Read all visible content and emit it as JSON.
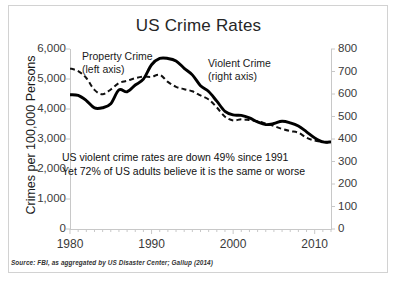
{
  "chart_data": {
    "type": "line",
    "title": "US Crime Rates",
    "xlabel": "",
    "ylabel": "Crimes per 100,000 Persons",
    "y2label": "",
    "xlim": [
      1980,
      2012
    ],
    "ylim": [
      0,
      6000
    ],
    "y2lim": [
      0,
      800
    ],
    "grid": false,
    "legend_position": "in-plot-annotations",
    "x_ticks": [
      1980,
      1990,
      2000,
      2010
    ],
    "x_tick_labels": [
      "1980",
      "1990",
      "2000",
      "2010"
    ],
    "x_minor_tick_interval": 1,
    "y_ticks_left": [
      0,
      1000,
      2000,
      3000,
      4000,
      5000,
      6000
    ],
    "y_tick_labels_left": [
      "0",
      "1,000",
      "2,000",
      "3,000",
      "4,000",
      "5,000",
      "6,000"
    ],
    "y_ticks_right": [
      0,
      100,
      200,
      300,
      400,
      500,
      600,
      700,
      800
    ],
    "y_tick_labels_right": [
      "0",
      "100",
      "200",
      "300",
      "400",
      "500",
      "600",
      "700",
      "800"
    ],
    "x": [
      1980,
      1981,
      1982,
      1983,
      1984,
      1985,
      1986,
      1987,
      1988,
      1989,
      1990,
      1991,
      1992,
      1993,
      1994,
      1995,
      1996,
      1997,
      1998,
      1999,
      2000,
      2001,
      2002,
      2003,
      2004,
      2005,
      2006,
      2007,
      2008,
      2009,
      2010,
      2011,
      2012
    ],
    "series": [
      {
        "name": "Property Crime",
        "axis": "left",
        "style": "dashed",
        "color": "#111111",
        "label_line1": "Property Crime",
        "label_line2": "(left axis)",
        "values": [
          5353,
          5264,
          5033,
          4637,
          4492,
          4651,
          4863,
          4940,
          5027,
          5078,
          5073,
          5140,
          4903,
          4740,
          4660,
          4591,
          4451,
          4316,
          4053,
          3744,
          3618,
          3658,
          3631,
          3591,
          3514,
          3432,
          3335,
          3264,
          3213,
          3041,
          2946,
          2905,
          2859
        ]
      },
      {
        "name": "Violent Crime",
        "axis": "right",
        "style": "solid",
        "color": "#000000",
        "label_line1": "Violent Crime",
        "label_line2": "(right axis)",
        "values": [
          597,
          594,
          571,
          538,
          539,
          557,
          618,
          610,
          640,
          666,
          730,
          758,
          758,
          747,
          714,
          685,
          637,
          611,
          568,
          523,
          507,
          505,
          494,
          476,
          464,
          469,
          479,
          472,
          458,
          432,
          405,
          387,
          387
        ]
      }
    ],
    "annotations": [
      "US violent crime rates are down 49% since 1991",
      "Yet 72% of US adults believe it is the same or worse"
    ],
    "source": "Source: FBI, as aggregated by US Disaster Center; Gallup (2014)"
  }
}
